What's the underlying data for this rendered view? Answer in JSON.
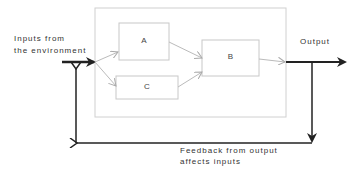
{
  "diagram": {
    "type": "feedback-loop block diagram",
    "labels": {
      "input_line1": "Inputs from",
      "input_line2": "the environment",
      "output": "Output",
      "feedback_line1": "Feedback from output",
      "feedback_line2": "affects inputs"
    },
    "boxes": [
      {
        "id": "A",
        "label": "A"
      },
      {
        "id": "B",
        "label": "B"
      },
      {
        "id": "C",
        "label": "C"
      }
    ],
    "edges": [
      {
        "from": "input",
        "to": "A"
      },
      {
        "from": "input",
        "to": "C"
      },
      {
        "from": "A",
        "to": "B"
      },
      {
        "from": "C",
        "to": "B"
      },
      {
        "from": "B",
        "to": "output"
      },
      {
        "from": "output",
        "to": "input",
        "label": "feedback"
      }
    ],
    "colors": {
      "heavy_line": "#222222",
      "light_line": "#bbbbbb",
      "box_border": "#c8c8c8",
      "text": "#333333"
    }
  }
}
